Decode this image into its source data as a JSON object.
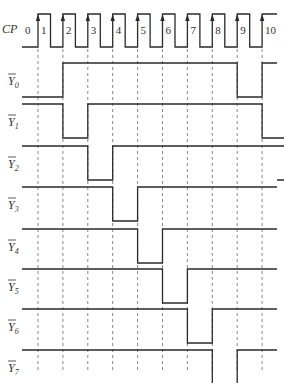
{
  "diagram": {
    "title": "",
    "clock": {
      "label": "CP",
      "pulse_numbers": [
        "0",
        "1",
        "2",
        "3",
        "4",
        "5",
        "6",
        "7",
        "8",
        "9",
        "10"
      ]
    },
    "signals": [
      {
        "name": "Y",
        "subscript": "0",
        "inverted": true,
        "low_intervals": [
          [
            0,
            1
          ],
          [
            8,
            9
          ]
        ]
      },
      {
        "name": "Y",
        "subscript": "1",
        "inverted": true,
        "low_intervals": [
          [
            1,
            2
          ],
          [
            9,
            10
          ]
        ]
      },
      {
        "name": "Y",
        "subscript": "2",
        "inverted": true,
        "low_intervals": [
          [
            2,
            3
          ],
          [
            10,
            11
          ]
        ]
      },
      {
        "name": "Y",
        "subscript": "3",
        "inverted": true,
        "low_intervals": [
          [
            3,
            4
          ]
        ]
      },
      {
        "name": "Y",
        "subscript": "4",
        "inverted": true,
        "low_intervals": [
          [
            4,
            5
          ]
        ]
      },
      {
        "name": "Y",
        "subscript": "5",
        "inverted": true,
        "low_intervals": [
          [
            5,
            6
          ]
        ]
      },
      {
        "name": "Y",
        "subscript": "6",
        "inverted": true,
        "low_intervals": [
          [
            6,
            7
          ]
        ]
      },
      {
        "name": "Y",
        "subscript": "7",
        "inverted": true,
        "low_intervals": [
          [
            7,
            8
          ]
        ]
      }
    ]
  }
}
